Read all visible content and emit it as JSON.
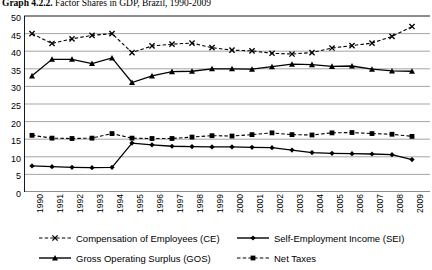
{
  "title": {
    "number": "Graph 4.2.2.",
    "text": "Factor Shares in GDP, Brazil, 1990-2009"
  },
  "chart_data": {
    "type": "line",
    "title": "Graph 4.2.2. Factor Shares in GDP, Brazil, 1990-2009",
    "xlabel": "",
    "ylabel": "",
    "ylim": [
      0,
      50
    ],
    "ytick_step": 5,
    "yticks": [
      "0",
      "5",
      "10",
      "15",
      "20",
      "25",
      "30",
      "35",
      "40",
      "45",
      "50"
    ],
    "grid": true,
    "legend_position": "bottom",
    "categories": [
      "1990",
      "1991",
      "1992",
      "1993",
      "1994",
      "1995",
      "1996",
      "1997",
      "1998",
      "1999",
      "2000",
      "2001",
      "2002",
      "2003",
      "2004",
      "2005",
      "2006",
      "2007",
      "2008",
      "2009"
    ],
    "series": [
      {
        "name": "Compensation of Employees (CE)",
        "key": "ce",
        "marker": "x",
        "dash": "dashed",
        "values": [
          45.0,
          42.2,
          43.5,
          44.5,
          45.0,
          39.6,
          41.5,
          42.0,
          42.3,
          41.0,
          40.3,
          40.1,
          39.4,
          39.2,
          39.6,
          40.9,
          41.6,
          42.3,
          44.2,
          47.0
        ]
      },
      {
        "name": "Self-Employment Income (SEI)",
        "key": "sei",
        "marker": "diamond",
        "dash": "solid",
        "values": [
          7.4,
          7.2,
          7.0,
          6.9,
          7.0,
          13.9,
          13.4,
          13.0,
          12.9,
          12.8,
          12.8,
          12.7,
          12.6,
          11.9,
          11.2,
          11.0,
          10.9,
          10.8,
          10.6,
          9.2
        ]
      },
      {
        "name": "Gross Operating Surplus (GOS)",
        "key": "gos",
        "marker": "triangle",
        "dash": "solid",
        "values": [
          33.0,
          37.7,
          37.7,
          36.5,
          38.1,
          31.1,
          33.0,
          34.2,
          34.3,
          35.0,
          35.0,
          34.9,
          35.6,
          36.3,
          36.2,
          35.7,
          35.8,
          34.9,
          34.4,
          34.3
        ]
      },
      {
        "name": "Net Taxes",
        "key": "nettax",
        "marker": "square",
        "dash": "dashed",
        "values": [
          16.1,
          15.3,
          15.2,
          15.3,
          16.6,
          15.3,
          15.2,
          15.2,
          15.6,
          16.0,
          15.9,
          16.3,
          16.8,
          16.3,
          16.2,
          16.8,
          16.9,
          16.6,
          16.4,
          15.8
        ]
      }
    ]
  },
  "legend": [
    {
      "label": "Compensation of Employees (CE)",
      "marker": "x",
      "dash": "dashed"
    },
    {
      "label": "Self-Employment Income (SEI)",
      "marker": "diamond",
      "dash": "solid"
    },
    {
      "label": "Gross Operating Surplus (GOS)",
      "marker": "triangle",
      "dash": "solid"
    },
    {
      "label": "Net Taxes",
      "marker": "square",
      "dash": "dashed"
    }
  ],
  "colors": {
    "line": "#000000",
    "grid": "#808080",
    "axis": "#000000",
    "background": "#ffffff"
  }
}
